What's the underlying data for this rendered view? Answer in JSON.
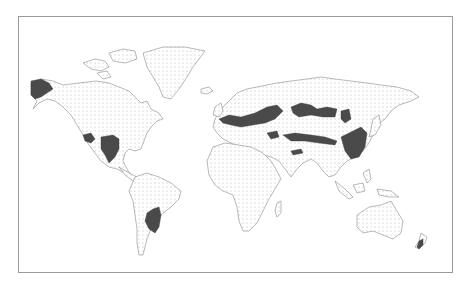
{
  "figure": {
    "type": "world-map",
    "style": "stippled landmasses with dark shaded regions",
    "colors": {
      "background": "#ffffff",
      "frame": "#9a9a9a",
      "land_outline": "#8a8a8a",
      "stipple": "#b0b0b0",
      "highlight": "#4a4a4a"
    },
    "highlighted_regions": [
      {
        "name": "Alaska"
      },
      {
        "name": "Western United States (Great Basin)"
      },
      {
        "name": "Central United States (Great Plains)"
      },
      {
        "name": "Pampas (Argentina / Uruguay)"
      },
      {
        "name": "Europe (Central / Eastern)"
      },
      {
        "name": "Ukraine / Southern Russia steppe"
      },
      {
        "name": "Kazakhstan / Central Asian steppe"
      },
      {
        "name": "Mongolia / Southern Siberia"
      },
      {
        "name": "Northern China"
      },
      {
        "name": "Central Asia (Tien Shan belt)"
      },
      {
        "name": "Iran / Turkey plateau"
      },
      {
        "name": "New Zealand (South Island)"
      }
    ],
    "caption": ""
  }
}
